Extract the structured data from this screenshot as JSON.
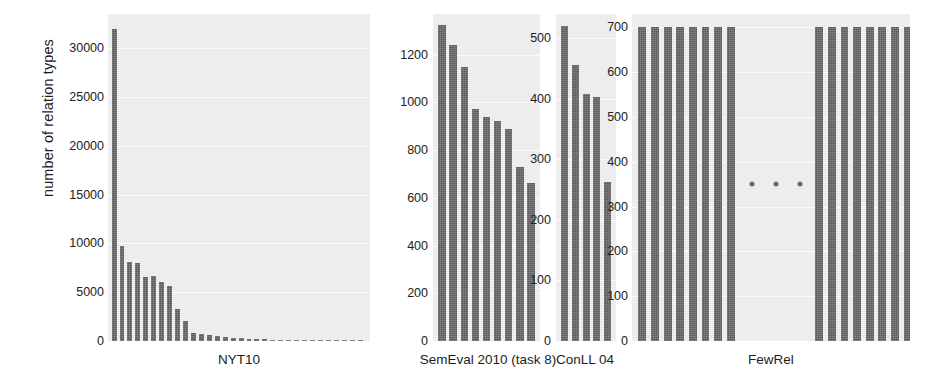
{
  "figure": {
    "ylabel": "number of relation types",
    "background": "#ffffff",
    "plot_background": "#ededed",
    "bar_color": "#5b5b5b"
  },
  "chart_data": {
    "type": "bar",
    "title": "",
    "xlabel": "",
    "ylabel": "number of relation types",
    "grid": true,
    "legend": null,
    "panels": [
      {
        "name": "NYT10",
        "xlabel": "NYT10",
        "ylim": [
          0,
          33500
        ],
        "yticks": [
          0,
          5000,
          10000,
          15000,
          20000,
          25000,
          30000
        ],
        "ytick_labels": [
          "0",
          "5000",
          "10000",
          "15000",
          "20000",
          "25000",
          "30000"
        ],
        "values": [
          32000,
          9700,
          8100,
          8000,
          6600,
          6700,
          6000,
          5600,
          3300,
          2000,
          850,
          700,
          600,
          520,
          430,
          360,
          300,
          250,
          200,
          160,
          130,
          100,
          80,
          60,
          45,
          35,
          25,
          18,
          12,
          8,
          5,
          3
        ],
        "bar_count": 32
      },
      {
        "name": "SemEval 2010 (task 8)",
        "xlabel": "SemEval 2010 (task 8)",
        "ylim": [
          0,
          1370
        ],
        "yticks": [
          0,
          200,
          400,
          600,
          800,
          1000,
          1200
        ],
        "ytick_labels": [
          "0",
          "200",
          "400",
          "600",
          "800",
          "1000",
          "1200"
        ],
        "values": [
          1325,
          1240,
          1150,
          970,
          940,
          920,
          890,
          730,
          660
        ],
        "bar_count": 9
      },
      {
        "name": "ConLL 04",
        "xlabel": "ConLL 04",
        "ylim": [
          0,
          540
        ],
        "yticks": [
          0,
          100,
          200,
          300,
          400,
          500
        ],
        "ytick_labels": [
          "0",
          "100",
          "200",
          "300",
          "400",
          "500"
        ],
        "values": [
          520,
          455,
          408,
          403,
          262
        ],
        "bar_count": 5
      },
      {
        "name": "FewRel",
        "xlabel": "FewRel",
        "ylim": [
          0,
          730
        ],
        "yticks": [
          0,
          100,
          200,
          300,
          400,
          500,
          600,
          700
        ],
        "ytick_labels": [
          "0",
          "100",
          "200",
          "300",
          "400",
          "500",
          "600",
          "700"
        ],
        "values": [
          700,
          700,
          700,
          700,
          700,
          700,
          700,
          700,
          700,
          700,
          700,
          700,
          700,
          700,
          700,
          700
        ],
        "bar_count": 16,
        "ellipsis": {
          "y": 350,
          "count": 3
        }
      }
    ]
  }
}
